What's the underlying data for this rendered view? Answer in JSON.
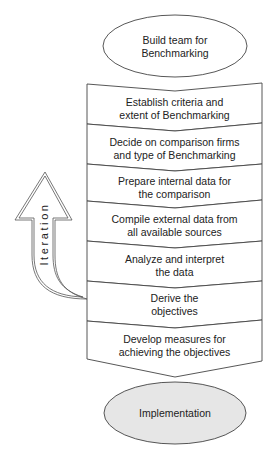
{
  "diagram": {
    "type": "flowchart",
    "start": {
      "label": "Build team for\nBenchmarking",
      "shape": "ellipse",
      "fill": "#ffffff"
    },
    "steps": [
      {
        "label": "Establish criteria and\nextent of Benchmarking"
      },
      {
        "label": "Decide on comparison firms\nand type of Benchmarking"
      },
      {
        "label": "Prepare internal data for\nthe comparison"
      },
      {
        "label": "Compile external data from\nall available sources"
      },
      {
        "label": "Analyze and interpret\nthe data"
      },
      {
        "label": "Derive the\nobjectives"
      },
      {
        "label": "Develop measures for\nachieving the objectives"
      }
    ],
    "end": {
      "label": "Implementation",
      "shape": "ellipse",
      "fill": "#e6e6e6"
    },
    "loop_arrow": {
      "label": "Iteration",
      "direction": "up",
      "from_step": "Derive the objectives"
    },
    "colors": {
      "stroke": "#444444",
      "end_fill": "#e6e6e6",
      "background": "#ffffff"
    }
  }
}
